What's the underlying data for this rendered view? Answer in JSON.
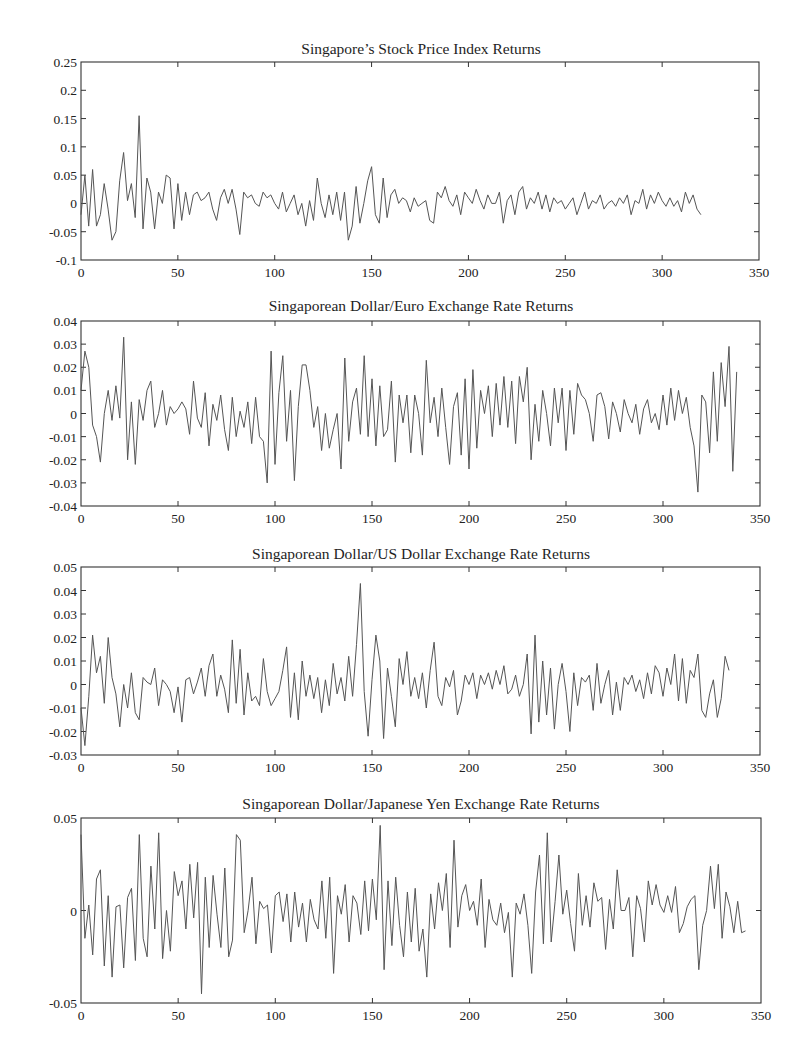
{
  "chart_data": [
    {
      "type": "line",
      "title": "Singapore’s Stock Price Index Returns",
      "xlabel": "",
      "ylabel": "",
      "xlim": [
        0,
        350
      ],
      "ylim": [
        -0.1,
        0.25
      ],
      "xticks": [
        0,
        50,
        100,
        150,
        200,
        250,
        300,
        350
      ],
      "yticks": [
        0.25,
        0.2,
        0.15,
        0.1,
        0.05,
        0,
        -0.05,
        -0.1
      ],
      "ytick_labels": [
        "0.25",
        "0.2",
        "0.15",
        "0.1",
        "0.05",
        "0",
        "-0.05",
        "-0.1"
      ],
      "grid": false,
      "legend": null,
      "series": [
        {
          "name": "Stock Price Index Returns",
          "x_step": 2,
          "values": [
            -0.02,
            0.05,
            -0.04,
            0.06,
            -0.04,
            -0.02,
            0.035,
            -0.01,
            -0.065,
            -0.05,
            0.04,
            0.09,
            0.005,
            0.035,
            -0.025,
            0.155,
            -0.045,
            0.045,
            0.02,
            -0.045,
            0.02,
            0.0,
            0.05,
            0.045,
            -0.045,
            0.035,
            -0.03,
            0.02,
            -0.02,
            0.015,
            0.02,
            0.005,
            0.01,
            0.02,
            -0.01,
            -0.03,
            0.01,
            0.025,
            0.0,
            0.025,
            -0.01,
            -0.055,
            0.02,
            0.01,
            0.015,
            0.0,
            -0.005,
            0.02,
            0.01,
            0.015,
            0.0,
            -0.01,
            0.02,
            -0.015,
            0.0,
            0.015,
            -0.02,
            0.0,
            -0.04,
            0.005,
            -0.03,
            0.045,
            0.0,
            -0.025,
            0.015,
            -0.02,
            0.02,
            -0.03,
            0.02,
            -0.065,
            -0.04,
            0.03,
            -0.035,
            0.0,
            0.04,
            0.065,
            -0.02,
            -0.035,
            0.045,
            -0.025,
            0.015,
            0.025,
            0.0,
            0.01,
            0.005,
            -0.015,
            0.01,
            -0.005,
            0.0,
            0.005,
            -0.03,
            -0.035,
            0.02,
            0.01,
            0.03,
            0.005,
            -0.005,
            0.015,
            -0.02,
            0.02,
            0.01,
            0.0,
            0.025,
            0.005,
            -0.01,
            0.015,
            0.0,
            0.0,
            0.02,
            -0.035,
            0.005,
            0.015,
            -0.02,
            0.02,
            0.03,
            -0.01,
            0.01,
            0.0,
            0.02,
            -0.01,
            0.015,
            -0.015,
            0.01,
            0.0,
            0.005,
            -0.01,
            0.0,
            0.01,
            -0.02,
            0.0,
            0.02,
            -0.01,
            0.005,
            0.0,
            0.015,
            -0.01,
            0.0,
            0.005,
            -0.005,
            0.01,
            0.0,
            0.015,
            -0.02,
            0.005,
            0.0,
            0.025,
            -0.01,
            0.015,
            0.0,
            0.02,
            0.005,
            -0.005,
            0.01,
            -0.005,
            0.005,
            -0.015,
            0.02,
            0.0,
            0.015,
            -0.01,
            -0.02
          ]
        }
      ]
    },
    {
      "type": "line",
      "title": "Singaporean Dollar/Euro Exchange Rate Returns",
      "xlabel": "",
      "ylabel": "",
      "xlim": [
        0,
        350
      ],
      "ylim": [
        -0.04,
        0.04
      ],
      "xticks": [
        0,
        50,
        100,
        150,
        200,
        250,
        300,
        350
      ],
      "yticks": [
        0.04,
        0.03,
        0.02,
        0.01,
        0,
        -0.01,
        -0.02,
        -0.03,
        -0.04
      ],
      "ytick_labels": [
        "0.04",
        "0.03",
        "0.02",
        "0.01",
        "0",
        "-0.01",
        "-0.02",
        "-0.03",
        "-0.04"
      ],
      "grid": false,
      "legend": null,
      "series": [
        {
          "name": "SGD/EUR Returns",
          "x_step": 2,
          "values": [
            0.01,
            0.027,
            0.02,
            -0.005,
            -0.01,
            -0.021,
            0.0,
            0.01,
            -0.003,
            0.012,
            -0.002,
            0.033,
            -0.02,
            0.005,
            -0.022,
            0.006,
            -0.003,
            0.01,
            0.014,
            -0.006,
            0.0,
            0.01,
            -0.005,
            0.003,
            0.0,
            0.002,
            0.005,
            0.002,
            -0.009,
            0.014,
            -0.002,
            -0.006,
            0.009,
            -0.014,
            0.004,
            -0.003,
            0.008,
            -0.007,
            -0.016,
            0.007,
            -0.01,
            0.001,
            -0.006,
            0.005,
            -0.013,
            0.007,
            -0.01,
            -0.012,
            -0.03,
            0.027,
            -0.022,
            0.009,
            0.025,
            -0.012,
            0.01,
            -0.029,
            0.003,
            0.021,
            0.021,
            0.01,
            -0.006,
            0.003,
            -0.016,
            0.0,
            -0.015,
            -0.007,
            0.0,
            -0.024,
            0.024,
            -0.012,
            0.005,
            0.011,
            -0.009,
            0.025,
            -0.01,
            0.015,
            -0.014,
            0.012,
            -0.01,
            -0.007,
            0.014,
            -0.021,
            0.008,
            -0.004,
            0.008,
            -0.017,
            0.008,
            0.0,
            -0.018,
            0.023,
            -0.004,
            0.007,
            -0.01,
            0.011,
            -0.006,
            -0.022,
            0.003,
            0.009,
            -0.018,
            0.015,
            -0.024,
            0.019,
            -0.015,
            0.01,
            0.0,
            0.012,
            -0.01,
            0.013,
            -0.005,
            0.016,
            -0.006,
            0.014,
            -0.013,
            0.016,
            0.005,
            0.02,
            -0.02,
            0.004,
            -0.012,
            0.01,
            0.0,
            -0.014,
            0.011,
            -0.004,
            0.011,
            -0.016,
            0.01,
            -0.009,
            0.013,
            0.008,
            0.006,
            0.0,
            -0.012,
            0.008,
            0.009,
            0.003,
            -0.011,
            0.005,
            0.0,
            -0.008,
            0.006,
            0.0,
            -0.004,
            0.004,
            -0.009,
            0.002,
            0.006,
            -0.004,
            0.0,
            -0.007,
            0.008,
            -0.005,
            0.011,
            -0.003,
            0.01,
            0.0,
            0.007,
            -0.006,
            -0.014,
            -0.034,
            0.008,
            0.005,
            -0.017,
            0.018,
            -0.012,
            0.022,
            0.003,
            0.029,
            -0.025,
            0.018
          ]
        }
      ]
    },
    {
      "type": "line",
      "title": "Singaporean Dollar/US Dollar Exchange Rate Returns",
      "xlabel": "",
      "ylabel": "",
      "xlim": [
        0,
        350
      ],
      "ylim": [
        -0.03,
        0.05
      ],
      "xticks": [
        0,
        50,
        100,
        150,
        200,
        250,
        300,
        350
      ],
      "yticks": [
        0.05,
        0.04,
        0.03,
        0.02,
        0.01,
        0,
        -0.01,
        -0.02,
        -0.03
      ],
      "ytick_labels": [
        "0.05",
        "0.04",
        "0.03",
        "0.02",
        "0.01",
        "0",
        "-0.01",
        "-0.02",
        "-0.03"
      ],
      "grid": false,
      "legend": null,
      "series": [
        {
          "name": "SGD/USD Returns",
          "x_step": 2,
          "values": [
            -0.01,
            -0.026,
            -0.005,
            0.021,
            0.005,
            0.012,
            -0.008,
            0.02,
            0.003,
            -0.004,
            -0.018,
            0.0,
            -0.01,
            0.005,
            -0.012,
            -0.015,
            0.003,
            0.001,
            0.0,
            0.007,
            -0.009,
            0.002,
            0.0,
            -0.003,
            -0.012,
            -0.001,
            -0.016,
            0.002,
            0.003,
            -0.004,
            0.001,
            0.007,
            -0.005,
            0.008,
            0.013,
            -0.005,
            0.004,
            -0.002,
            -0.012,
            0.019,
            -0.008,
            0.015,
            -0.013,
            0.005,
            -0.007,
            -0.005,
            -0.009,
            0.011,
            -0.003,
            -0.009,
            -0.006,
            -0.003,
            0.006,
            0.016,
            -0.014,
            0.005,
            -0.015,
            0.01,
            -0.005,
            0.004,
            -0.006,
            0.003,
            -0.012,
            0.002,
            -0.009,
            0.009,
            -0.004,
            0.003,
            -0.007,
            0.012,
            -0.005,
            0.017,
            0.043,
            -0.003,
            -0.022,
            0.002,
            0.021,
            0.01,
            -0.023,
            0.007,
            -0.005,
            -0.018,
            0.011,
            0.0,
            0.014,
            -0.005,
            0.003,
            -0.006,
            0.005,
            -0.01,
            0.006,
            0.018,
            -0.005,
            -0.009,
            0.003,
            -0.001,
            0.006,
            -0.013,
            -0.007,
            0.004,
            0.0,
            0.005,
            -0.006,
            0.004,
            0.0,
            0.005,
            -0.002,
            0.006,
            0.0,
            0.008,
            -0.004,
            -0.002,
            0.004,
            -0.005,
            0.0,
            0.013,
            -0.021,
            0.021,
            -0.016,
            0.01,
            -0.013,
            0.007,
            -0.019,
            0.0,
            0.009,
            -0.003,
            -0.02,
            0.005,
            -0.009,
            0.003,
            0.001,
            0.004,
            -0.011,
            0.009,
            -0.008,
            0.0,
            0.006,
            -0.013,
            0.001,
            -0.011,
            0.003,
            0.0,
            0.004,
            -0.003,
            0.002,
            -0.006,
            0.005,
            -0.004,
            0.008,
            0.005,
            -0.005,
            0.007,
            0.0,
            0.013,
            -0.007,
            0.011,
            -0.008,
            0.006,
            0.003,
            0.013,
            -0.011,
            -0.014,
            -0.004,
            0.002,
            -0.014,
            -0.006,
            0.012,
            0.006
          ]
        }
      ]
    },
    {
      "type": "line",
      "title": "Singaporean Dollar/Japanese Yen Exchange Rate Returns",
      "xlabel": "",
      "ylabel": "",
      "xlim": [
        0,
        350
      ],
      "ylim": [
        -0.05,
        0.05
      ],
      "xticks": [
        0,
        50,
        100,
        150,
        200,
        250,
        300,
        350
      ],
      "yticks": [
        0.05,
        0,
        -0.05
      ],
      "ytick_labels": [
        "0.05",
        "0",
        "-0.05"
      ],
      "grid": false,
      "legend": null,
      "series": [
        {
          "name": "SGD/JPY Returns",
          "x_step": 2,
          "values": [
            0.041,
            -0.015,
            0.003,
            -0.024,
            0.017,
            0.022,
            -0.03,
            0.008,
            -0.036,
            0.002,
            0.003,
            -0.031,
            0.007,
            0.012,
            -0.027,
            0.041,
            -0.015,
            -0.025,
            0.024,
            -0.01,
            0.042,
            -0.026,
            0.0,
            -0.022,
            0.021,
            0.008,
            0.016,
            -0.01,
            0.025,
            -0.004,
            0.026,
            -0.045,
            0.018,
            -0.02,
            0.019,
            -0.002,
            -0.02,
            0.023,
            -0.025,
            -0.016,
            0.041,
            0.038,
            -0.012,
            0.0,
            0.018,
            -0.018,
            0.005,
            0.001,
            0.003,
            -0.023,
            0.008,
            0.01,
            -0.006,
            0.009,
            -0.017,
            0.01,
            -0.009,
            0.004,
            -0.017,
            0.006,
            -0.005,
            -0.01,
            0.016,
            -0.015,
            0.018,
            -0.034,
            0.008,
            -0.002,
            0.014,
            -0.017,
            0.008,
            0.004,
            -0.013,
            0.016,
            -0.011,
            0.017,
            -0.005,
            0.046,
            -0.032,
            0.016,
            -0.019,
            0.018,
            -0.008,
            -0.025,
            0.01,
            -0.017,
            0.012,
            -0.022,
            -0.01,
            -0.036,
            0.009,
            -0.01,
            0.015,
            0.0,
            0.02,
            -0.02,
            0.038,
            -0.009,
            0.008,
            0.014,
            0.0,
            0.005,
            -0.008,
            0.017,
            -0.02,
            0.006,
            -0.005,
            -0.008,
            0.004,
            -0.012,
            -0.001,
            -0.036,
            0.004,
            -0.002,
            0.009,
            -0.008,
            -0.034,
            0.01,
            0.03,
            -0.018,
            0.042,
            -0.017,
            0.005,
            0.03,
            -0.002,
            0.011,
            -0.007,
            -0.022,
            0.02,
            -0.008,
            0.008,
            -0.009,
            0.015,
            0.005,
            0.007,
            -0.021,
            0.006,
            -0.01,
            0.022,
            0.0,
            0.0,
            0.007,
            -0.025,
            0.008,
            0.001,
            -0.017,
            0.016,
            0.003,
            0.014,
            0.003,
            -0.001,
            0.008,
            -0.001,
            0.013,
            -0.012,
            -0.007,
            0.002,
            0.006,
            0.008,
            -0.032,
            -0.008,
            0.0,
            0.024,
            0.001,
            0.025,
            -0.015,
            0.01,
            0.002,
            -0.012,
            0.005,
            -0.012,
            -0.011
          ]
        }
      ]
    }
  ],
  "panels": [
    {
      "title": "Singapore’s Stock Price Index Returns"
    },
    {
      "title": "Singaporean Dollar/Euro Exchange Rate Returns"
    },
    {
      "title": "Singaporean Dollar/US Dollar Exchange Rate Returns"
    },
    {
      "title": "Singaporean Dollar/Japanese Yen Exchange Rate Returns"
    }
  ],
  "style": {
    "line_color": "#555555",
    "axis_color": "#333333",
    "text_color": "#222222",
    "background": "#ffffff"
  }
}
